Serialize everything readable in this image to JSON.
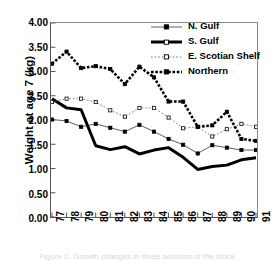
{
  "figure": {
    "ylabel": "Weight at age 7 (kg)",
    "caption_partial": "Figure 2.  Growth changes in three sections of the stock"
  },
  "legend": {
    "position": "top-right",
    "items": [
      {
        "label": "N. Gulf",
        "key": "thin-line-filled-square"
      },
      {
        "label": "S. Gulf",
        "key": "thick-solid-line"
      },
      {
        "label": "E. Scotian Shelf",
        "key": "dotted-line-open-square"
      },
      {
        "label": "Northern",
        "key": "dotted-line-filled-square"
      }
    ]
  },
  "colors": {
    "ink": "#000000",
    "axis": "#555555",
    "frame": "#8a8a8a",
    "background": "#ffffff"
  },
  "chart_data": {
    "type": "line",
    "title": "",
    "xlabel": "",
    "ylabel": "Weight at age 7 (kg)",
    "x": [
      "77",
      "78",
      "79",
      "80",
      "81",
      "82",
      "83",
      "84",
      "85",
      "86",
      "87",
      "88",
      "89",
      "90",
      "91"
    ],
    "categories": [
      "77",
      "78",
      "79",
      "80",
      "81",
      "82",
      "83",
      "84",
      "85",
      "86",
      "87",
      "88",
      "89",
      "90",
      "91"
    ],
    "xlim": [
      0,
      14
    ],
    "ylim": [
      0.0,
      4.0
    ],
    "yticks": [
      "0.00",
      "0.50",
      "1.00",
      "1.50",
      "2.00",
      "2.50",
      "3.00",
      "3.50",
      "4.00"
    ],
    "ytick_values": [
      0.0,
      0.5,
      1.0,
      1.5,
      2.0,
      2.5,
      3.0,
      3.5,
      4.0
    ],
    "grid": false,
    "legend": "top-right",
    "series": [
      {
        "name": "N. Gulf",
        "style": "thin-solid",
        "marker": "filled-square",
        "values": [
          2.01,
          1.98,
          1.86,
          1.92,
          1.84,
          1.76,
          1.9,
          1.76,
          1.61,
          1.49,
          1.31,
          1.48,
          1.43,
          1.38,
          1.38
        ]
      },
      {
        "name": "S. Gulf",
        "style": "thick-solid",
        "marker": "none",
        "values": [
          2.44,
          2.25,
          2.21,
          1.47,
          1.39,
          1.45,
          1.3,
          1.38,
          1.43,
          1.23,
          0.98,
          1.04,
          1.07,
          1.18,
          1.22
        ]
      },
      {
        "name": "E. Scotian Shelf",
        "style": "dotted",
        "marker": "open-square",
        "values": [
          2.37,
          2.44,
          2.44,
          2.37,
          2.2,
          2.07,
          2.25,
          2.25,
          2.05,
          1.83,
          1.86,
          1.66,
          1.81,
          1.92,
          1.86
        ]
      },
      {
        "name": "Northern",
        "style": "dotted-bold",
        "marker": "filled-square",
        "values": [
          3.16,
          3.41,
          3.07,
          3.11,
          3.05,
          2.74,
          3.1,
          2.88,
          2.38,
          2.38,
          1.86,
          1.89,
          2.17,
          1.61,
          1.57
        ]
      }
    ]
  }
}
